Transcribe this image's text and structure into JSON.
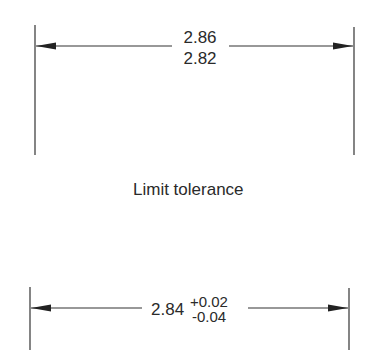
{
  "diagram": {
    "top_dimension": {
      "upper_limit": "2.86",
      "lower_limit": "2.82"
    },
    "caption": "Limit tolerance",
    "bottom_dimension": {
      "nominal": "2.84",
      "plus_tolerance": "+0.02",
      "minus_tolerance": "-0.04"
    },
    "colors": {
      "line": "#333333",
      "text": "#2a2a2a",
      "background": "#ffffff"
    }
  }
}
